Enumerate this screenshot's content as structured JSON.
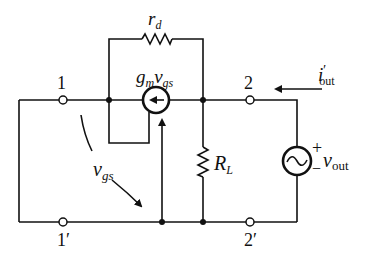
{
  "diagram": {
    "type": "circuit",
    "colors": {
      "stroke": "#111111",
      "background": "#ffffff"
    },
    "nodes": {
      "n1": {
        "label": "1"
      },
      "n1p": {
        "label": "1′"
      },
      "n2": {
        "label": "2"
      },
      "n2p": {
        "label": "2′"
      }
    },
    "components": {
      "rd": {
        "type": "resistor",
        "label_main": "r",
        "label_sub": "d"
      },
      "gm_source": {
        "type": "dependent-current-source",
        "label_g": "g",
        "label_gsub": "m",
        "label_v": "v",
        "label_vsub": "gs"
      },
      "rl": {
        "type": "resistor",
        "label_main": "R",
        "label_sub": "L"
      },
      "vout_source": {
        "type": "ac-voltage-source",
        "plus": "+",
        "minus": "−",
        "label_main": "v",
        "label_sub": "out"
      }
    },
    "annotations": {
      "vgs": {
        "label_main": "v",
        "label_sub": "gs"
      },
      "iout": {
        "label_main": "i",
        "label_prime": "′",
        "label_sub": "out"
      }
    }
  }
}
